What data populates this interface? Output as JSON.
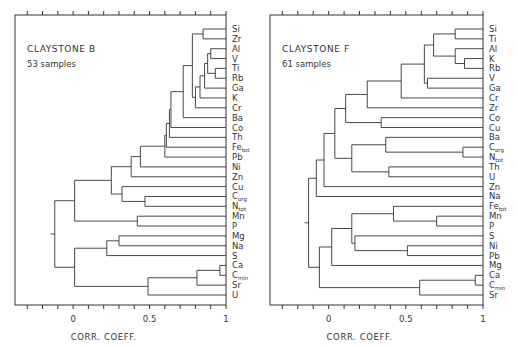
{
  "chart_data": [
    {
      "type": "dendrogram",
      "title": "CLAYSTONE B",
      "subtitle": "53 samples",
      "xlabel": "CORR. COEFF.",
      "xlim": [
        -0.38,
        1
      ],
      "xticks": [
        "0",
        "0.5",
        "1"
      ],
      "leaves": [
        "Si",
        "Zr",
        "Al",
        "V",
        "Ti",
        "Rb",
        "Ga",
        "K",
        "Cr",
        "Ba",
        "Co",
        "Th",
        "Fe_tot",
        "Pb",
        "Ni",
        "Zn",
        "Cu",
        "C_org",
        "N_tot",
        "Mn",
        "P",
        "Mg",
        "Na",
        "S",
        "Ca",
        "C_min",
        "Sr",
        "U"
      ],
      "merges": [
        {
          "a": "Ti",
          "b": "Rb",
          "r": 0.93
        },
        {
          "a": "Al",
          "b": "V",
          "r": 0.9
        },
        {
          "a": "Al+V",
          "b": "Ti+Rb",
          "r": 0.88
        },
        {
          "a": "Si",
          "b": "Zr",
          "r": 0.85
        },
        {
          "a": "AlVTiRb",
          "b": "Ga",
          "r": 0.86
        },
        {
          "a": "+Ga",
          "b": "K",
          "r": 0.83
        },
        {
          "a": "+K",
          "b": "Cr",
          "r": 0.8
        },
        {
          "a": "Si+Zr",
          "b": "AlV..Cr",
          "r": 0.78
        },
        {
          "a": "+",
          "b": "Ba",
          "r": 0.72
        },
        {
          "a": "+",
          "b": "Co",
          "r": 0.64
        },
        {
          "a": "+",
          "b": "Th",
          "r": 0.63
        },
        {
          "a": "+",
          "b": "Fe_tot",
          "r": 0.61
        },
        {
          "a": "+",
          "b": "Pb",
          "r": 0.6
        },
        {
          "a": "+",
          "b": "Ni",
          "r": 0.44
        },
        {
          "a": "+",
          "b": "Zn",
          "r": 0.38
        },
        {
          "a": "C_org",
          "b": "N_tot",
          "r": 0.47
        },
        {
          "a": "Cu",
          "b": "C_org+N_tot",
          "r": 0.32
        },
        {
          "a": "Mn",
          "b": "P",
          "r": 0.42
        },
        {
          "a": "Si..Zn",
          "b": "Cu..N_tot",
          "r": 0.25
        },
        {
          "a": "+",
          "b": "Mn+P",
          "r": 0.01
        },
        {
          "a": "Mg",
          "b": "Na",
          "r": 0.3
        },
        {
          "a": "Mg+Na",
          "b": "S",
          "r": 0.22
        },
        {
          "a": "Ca",
          "b": "C_min",
          "r": 0.96
        },
        {
          "a": "Ca+C_min",
          "b": "Sr",
          "r": 0.81
        },
        {
          "a": "+Sr",
          "b": "U",
          "r": 0.49
        },
        {
          "a": "MgNaS",
          "b": "CaCminSrU",
          "r": 0.01
        },
        {
          "a": "upper",
          "b": "lower",
          "r": -0.12
        }
      ]
    },
    {
      "type": "dendrogram",
      "title": "CLAYSTONE F",
      "subtitle": "61 samples",
      "xlabel": "CORR. COEFF.",
      "xlim": [
        -0.38,
        1
      ],
      "xticks": [
        "0",
        "0.5",
        "1"
      ],
      "leaves": [
        "Si",
        "Ti",
        "Al",
        "K",
        "Rb",
        "V",
        "Ga",
        "Cr",
        "Zr",
        "Co",
        "Cu",
        "Ba",
        "C_org",
        "N_tot",
        "Th",
        "U",
        "Zn",
        "Na",
        "Fe_tot",
        "Mn",
        "P",
        "S",
        "Ni",
        "Pb",
        "Mg",
        "Ca",
        "C_min",
        "Sr"
      ],
      "merges": [
        {
          "a": "Si",
          "b": "Ti",
          "r": 0.82
        },
        {
          "a": "K",
          "b": "Rb",
          "r": 0.88
        },
        {
          "a": "Al",
          "b": "K+Rb",
          "r": 0.82
        },
        {
          "a": "Si+Ti",
          "b": "Al+K+Rb",
          "r": 0.68
        },
        {
          "a": "V",
          "b": "Ga",
          "r": 0.64
        },
        {
          "a": "SiTiAlKRb",
          "b": "V+Ga",
          "r": 0.62
        },
        {
          "a": "+",
          "b": "Cr",
          "r": 0.47
        },
        {
          "a": "+",
          "b": "Zr",
          "r": 0.25
        },
        {
          "a": "Co",
          "b": "Cu",
          "r": 0.34
        },
        {
          "a": "Si..Zr",
          "b": "Co+Cu",
          "r": 0.11
        },
        {
          "a": "C_org",
          "b": "N_tot",
          "r": 0.87
        },
        {
          "a": "Ba",
          "b": "C_org+N_tot",
          "r": 0.37
        },
        {
          "a": "Th",
          "b": "U",
          "r": 0.39
        },
        {
          "a": "Ba..N_tot",
          "b": "Th+U",
          "r": 0.15
        },
        {
          "a": "Si..Cu",
          "b": "Ba..U",
          "r": 0.04
        },
        {
          "a": "+",
          "b": "Zn",
          "r": -0.03
        },
        {
          "a": "+",
          "b": "Na",
          "r": -0.08
        },
        {
          "a": "Mn",
          "b": "P",
          "r": 0.7
        },
        {
          "a": "Fe_tot",
          "b": "Mn+P",
          "r": 0.42
        },
        {
          "a": "Ni",
          "b": "Pb",
          "r": 0.51
        },
        {
          "a": "S",
          "b": "Ni+Pb",
          "r": 0.17
        },
        {
          "a": "FeMnP",
          "b": "SNiPb",
          "r": 0.15
        },
        {
          "a": "+",
          "b": "Mg",
          "r": 0.02
        },
        {
          "a": "Ca",
          "b": "C_min",
          "r": 0.95
        },
        {
          "a": "Ca+C_min",
          "b": "Sr",
          "r": 0.59
        },
        {
          "a": "Fe..Mg",
          "b": "CaCminSr",
          "r": -0.06
        },
        {
          "a": "upper",
          "b": "lower",
          "r": -0.13
        }
      ]
    }
  ],
  "panels": {
    "left": {
      "title": "CLAYSTONE B",
      "subtitle": "53 samples",
      "xlabel": "CORR. COEFF.",
      "tick0": "0",
      "tick05": "0.5",
      "tick1": "1"
    },
    "right": {
      "title": "CLAYSTONE F",
      "subtitle": "61 samples",
      "xlabel": "CORR. COEFF.",
      "tick0": "0",
      "tick05": "0.5",
      "tick1": "1"
    }
  }
}
